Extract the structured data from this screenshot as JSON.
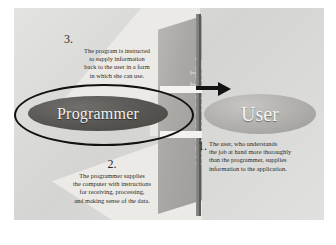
{
  "figure": {
    "plane_label": "Application",
    "entities": {
      "programmer": "Programmer",
      "user": "User"
    },
    "colors": {
      "page_background": "#dbdbd9",
      "plane": "#a9a8a4",
      "programmer_ellipse": "#565552",
      "user_ellipse": "#adaca8",
      "arrow": "#131313",
      "text": "#2a2a28"
    },
    "callouts": [
      {
        "number": "1.",
        "position": "right",
        "lines": [
          "The user, who understands",
          "the job at hand more thoroughly",
          "than the programmer, supplies",
          "information to the application."
        ]
      },
      {
        "number": "2.",
        "position": "bottom-left",
        "lines": [
          "The programmer supplies",
          "the computer with instructions",
          "for receiving, processing,",
          "and making sense of the data."
        ]
      },
      {
        "number": "3.",
        "position": "top-left",
        "lines": [
          "The program is instructed",
          "to supply information",
          "back to the user in a form",
          "in which she can use."
        ]
      }
    ]
  }
}
